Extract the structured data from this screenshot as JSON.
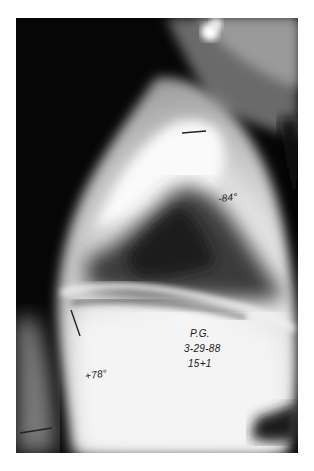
{
  "image": {
    "subject": "lateral spine radiograph",
    "annotations": {
      "upper_angle": "-84°",
      "lower_angle": "+78°",
      "patient_initials": "P.G.",
      "date": "3-29-88",
      "age": "15+1"
    }
  }
}
